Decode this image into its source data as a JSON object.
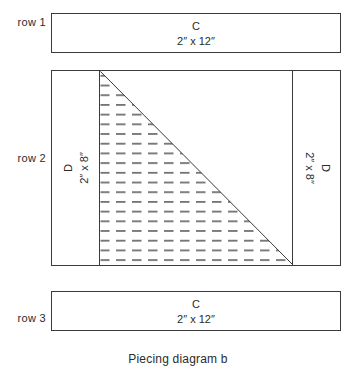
{
  "diagram": {
    "caption": "Piecing diagram b",
    "colors": {
      "line": "#3a3a3a",
      "hatch": "#555555",
      "text": "#2b2b2b",
      "background": "#ffffff"
    },
    "rows": [
      {
        "row_label": "row 1",
        "piece_letter": "C",
        "piece_size": "2″ x 12″"
      },
      {
        "row_label": "row 2",
        "left_piece_letter": "D",
        "left_piece_size": "2″ x 8″",
        "right_piece_letter": "D",
        "right_piece_size": "2″ x 8″"
      },
      {
        "row_label": "row 3",
        "piece_letter": "C",
        "piece_size": "2″ x 12″"
      }
    ]
  }
}
